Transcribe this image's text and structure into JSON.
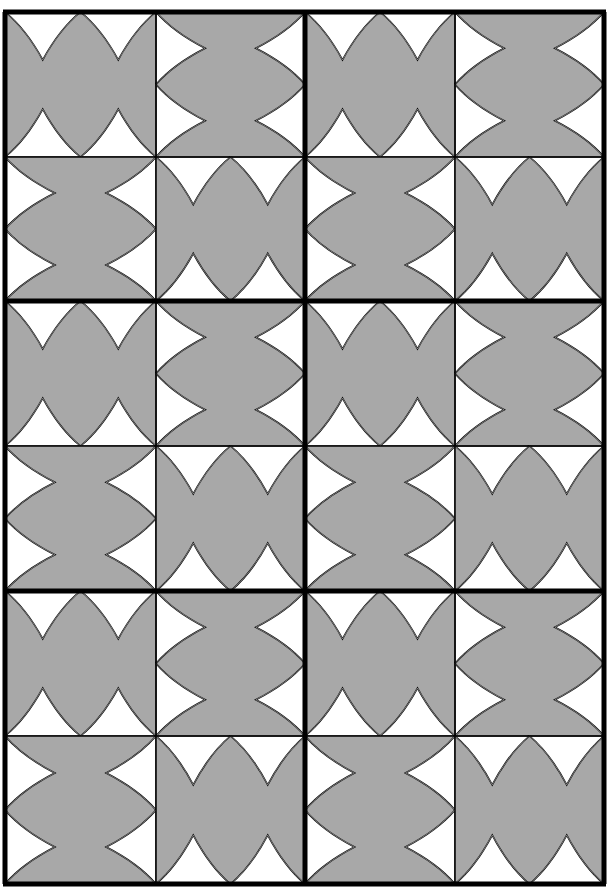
{
  "figure": {
    "colors": {
      "background": "#ffffff",
      "tile_fill": "#a8a8a8",
      "notch_fill": "#ffffff",
      "line": "#000000"
    },
    "grid": {
      "cols": 4,
      "rows": 6,
      "col_edges": [
        5,
        156,
        305,
        455,
        604
      ],
      "row_edges": [
        12,
        157,
        301,
        446,
        591,
        736,
        884
      ],
      "thick_col_edges": [
        0,
        2,
        4
      ],
      "thick_row_edges": [
        0,
        2,
        4,
        6
      ]
    },
    "tile_types": {
      "H": "notches on top and bottom edges",
      "V": "notches on left and right edges"
    },
    "layout": [
      [
        "H",
        "V",
        "H",
        "V"
      ],
      [
        "V",
        "H",
        "V",
        "H"
      ],
      [
        "H",
        "V",
        "H",
        "V"
      ],
      [
        "V",
        "H",
        "V",
        "H"
      ],
      [
        "H",
        "V",
        "H",
        "V"
      ],
      [
        "V",
        "H",
        "V",
        "H"
      ]
    ]
  }
}
